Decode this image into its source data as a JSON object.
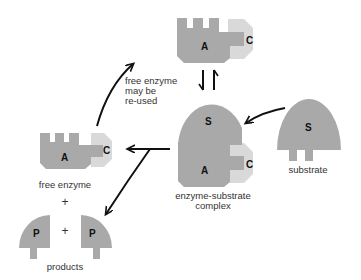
{
  "labels": {
    "reuse_note": [
      "free enzyme",
      "may be",
      "re-used"
    ],
    "free_enzyme": "free enzyme",
    "complex": [
      "enzyme-substrate",
      "complex"
    ],
    "substrate": "substrate",
    "products": "products",
    "plus": "+"
  },
  "letters": {
    "active_site": "A",
    "cofactor": "C",
    "substrate": "S",
    "product": "P"
  },
  "colors": {
    "enzyme_body": "#a9a9a9",
    "cofactor_cap": "#d9d9d9",
    "arrow": "#111111",
    "text": "#333333"
  }
}
